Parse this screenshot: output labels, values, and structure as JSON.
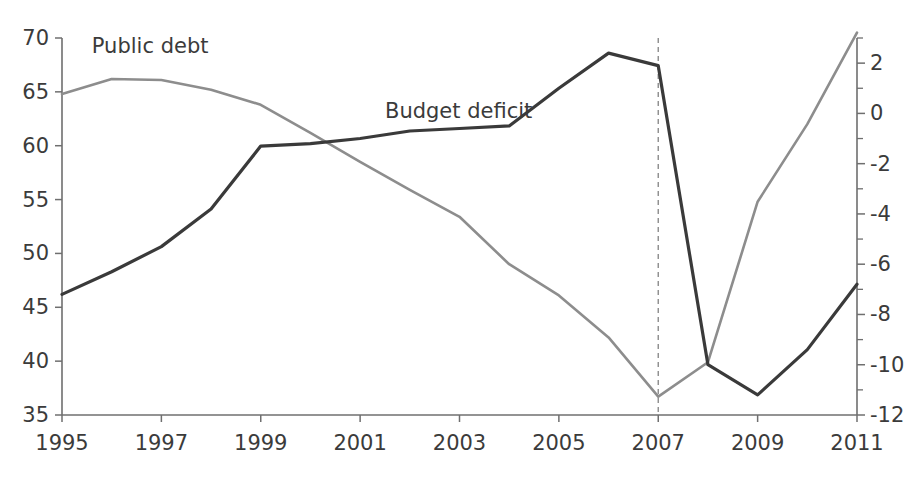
{
  "chart_data": {
    "type": "line",
    "title": "",
    "subtitle": "",
    "xlabel": "",
    "ylabel": "",
    "grid": false,
    "legend_position": "inline-annotations",
    "x": [
      1995,
      1996,
      1997,
      1998,
      1999,
      2000,
      2001,
      2002,
      2003,
      2004,
      2005,
      2006,
      2007,
      2008,
      2009,
      2010,
      2011
    ],
    "xticks": [
      "1995",
      "1997",
      "1999",
      "2001",
      "2003",
      "2005",
      "2007",
      "2009",
      "2011"
    ],
    "xtick_values": [
      1995,
      1997,
      1999,
      2001,
      2003,
      2005,
      2007,
      2009,
      2011
    ],
    "xlim": [
      1995,
      2011
    ],
    "left_axis": {
      "ticks": [
        "70",
        "65",
        "60",
        "55",
        "50",
        "45",
        "40",
        "35"
      ],
      "tick_values": [
        70,
        65,
        60,
        55,
        50,
        45,
        40,
        35
      ],
      "ylim": [
        35,
        70
      ],
      "label": ""
    },
    "right_axis": {
      "ticks": [
        "2",
        "0",
        "-2",
        "-4",
        "-6",
        "-8",
        "-10",
        "-12"
      ],
      "tick_values": [
        2,
        0,
        -2,
        -4,
        -6,
        -8,
        -10,
        -12
      ],
      "ylim": [
        -12,
        3
      ],
      "minor_tick_step": 1,
      "label": ""
    },
    "series": [
      {
        "name": "Public debt",
        "axis": "left",
        "color": "#8d8d8d",
        "stroke_width": 2.6,
        "label_x": 1995.6,
        "label_y": 68.6,
        "values": [
          64.8,
          66.2,
          66.1,
          65.2,
          63.8,
          61.2,
          58.5,
          55.9,
          53.4,
          49.0,
          46.1,
          42.2,
          36.7,
          39.9,
          54.8,
          62.0,
          70.5
        ]
      },
      {
        "name": "Budget deficit",
        "axis": "right",
        "color": "#3a3a3a",
        "stroke_width": 3.2,
        "label_x": 2001.5,
        "label_y": -0.2,
        "values": [
          -7.2,
          -6.3,
          -5.3,
          -3.8,
          -1.3,
          -1.2,
          -1.0,
          -0.7,
          -0.6,
          -0.5,
          1.0,
          2.4,
          1.9,
          -10.0,
          -11.2,
          -9.4,
          -6.8
        ]
      }
    ],
    "annotations": [
      {
        "name": "year-marker-2007",
        "type": "vertical-dashed-line",
        "x": 2007,
        "color": "#8c8c8c"
      }
    ]
  },
  "plot_geometry": {
    "left": 62,
    "right": 857,
    "top": 38,
    "bottom": 415
  }
}
